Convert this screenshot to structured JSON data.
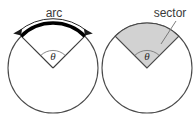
{
  "figure": {
    "background_color": "#ffffff",
    "width": 193,
    "height": 116
  },
  "colors": {
    "outline": "#4a4a4a",
    "arc_stroke": "#000000",
    "sector_fill": "#d2d2d2",
    "label_text": "#3a3a3a",
    "angle_mark": "#6b6b6b",
    "leader_line": "#6e6e6e"
  },
  "left_figure": {
    "name": "arc-circle",
    "label": "arc",
    "angle_symbol": "θ",
    "center": {
      "x": 53,
      "y": 68
    },
    "radius": 45,
    "angle_start_deg": 225,
    "angle_end_deg": 315,
    "arc_highlighted": true,
    "arrow": {
      "type": "double-headed-curved",
      "position": "above-arc"
    }
  },
  "right_figure": {
    "name": "sector-circle",
    "label": "sector",
    "angle_symbol": "θ",
    "center": {
      "x": 147,
      "y": 68
    },
    "radius": 45,
    "angle_start_deg": 225,
    "angle_end_deg": 315,
    "sector_shaded": true,
    "leader": {
      "from": {
        "x": 176,
        "y": 21
      },
      "to": {
        "x": 161,
        "y": 44
      }
    }
  }
}
